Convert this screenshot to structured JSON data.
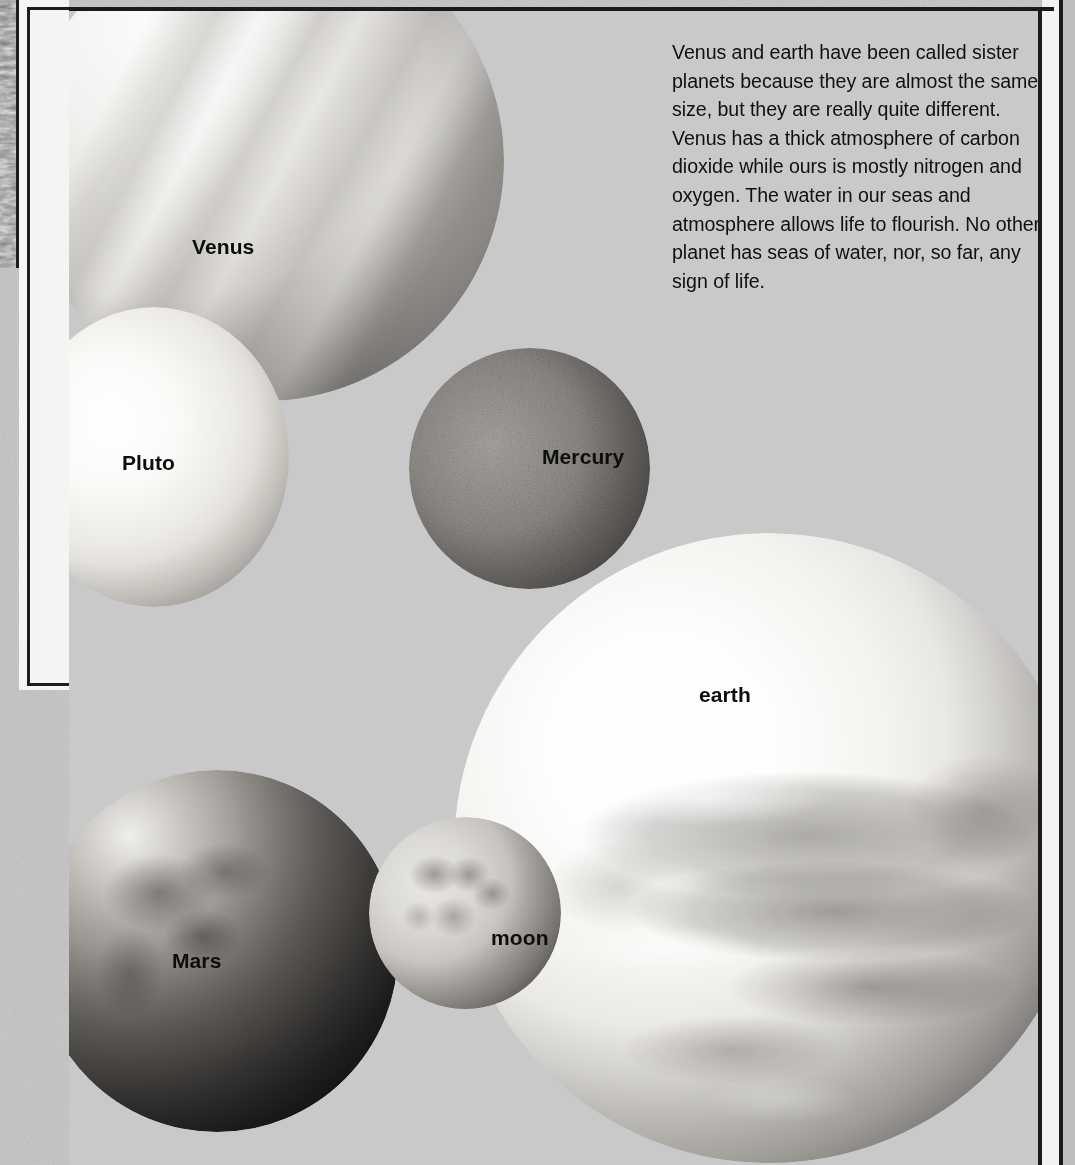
{
  "page": {
    "background_color": "#c6c6c6",
    "frame_color": "#1a1a1a",
    "label_color": "#0d0d0d"
  },
  "caption": {
    "text": "Venus and earth have been called sister planets because they are almost the same size, but they are really quite different. Venus has a thick atmosphere of carbon dioxide while ours is mostly nitrogen and oxygen. The water in our seas and atmosphere allows life to flourish. No other planet has  seas of  water, nor, so far, any sign of life."
  },
  "planets": [
    {
      "id": "venus",
      "label": "Venus"
    },
    {
      "id": "pluto",
      "label": "Pluto"
    },
    {
      "id": "mercury",
      "label": "Mercury"
    },
    {
      "id": "earth",
      "label": "earth"
    },
    {
      "id": "mars",
      "label": "Mars"
    },
    {
      "id": "moon",
      "label": "moon"
    }
  ]
}
